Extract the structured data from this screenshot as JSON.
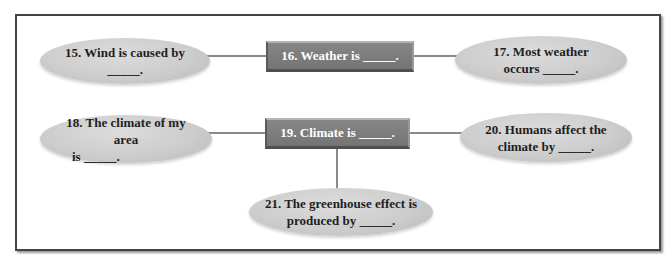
{
  "diagram": {
    "type": "concept-map",
    "nodes": {
      "n15": {
        "text": "15. Wind is caused by _____.",
        "shape": "ellipse"
      },
      "n16": {
        "text": "16. Weather is _____.",
        "shape": "box"
      },
      "n17": {
        "line1": "17. Most weather",
        "line2": "occurs _____.",
        "shape": "ellipse"
      },
      "n18": {
        "line1": "18. The climate of my area",
        "line2": "is _____.",
        "shape": "ellipse"
      },
      "n19": {
        "text": "19. Climate is _____.",
        "shape": "box"
      },
      "n20": {
        "line1": "20. Humans affect the",
        "line2": "climate by _____.",
        "shape": "ellipse"
      },
      "n21": {
        "line1": "21. The greenhouse effect is",
        "line2": "produced by _____.",
        "shape": "ellipse"
      }
    },
    "edges": [
      {
        "from": "n15",
        "to": "n16"
      },
      {
        "from": "n16",
        "to": "n17"
      },
      {
        "from": "n18",
        "to": "n19"
      },
      {
        "from": "n19",
        "to": "n20"
      },
      {
        "from": "n19",
        "to": "n21"
      }
    ],
    "colors": {
      "box_fill": "#7a7a7a",
      "box_text": "#ffffff",
      "ellipse_fill": "#cdcdcd",
      "ellipse_text": "#1e1e1e",
      "connector": "#8a8a8a",
      "frame": "#444444"
    }
  }
}
